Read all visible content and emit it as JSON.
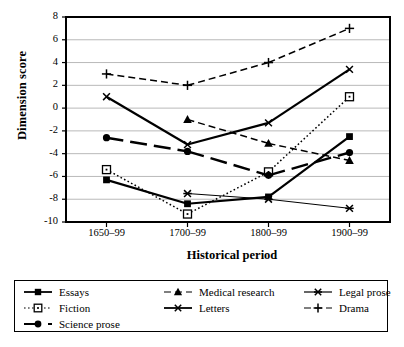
{
  "chart_data": {
    "type": "line",
    "title": "",
    "xlabel": "Historical period",
    "ylabel": "Dimension score",
    "categories": [
      "1650–99",
      "1700–99",
      "1800–99",
      "1900–99"
    ],
    "ylim": [
      -10,
      8
    ],
    "yticks": [
      8,
      6,
      4,
      2,
      0,
      -2,
      -4,
      -6,
      -8,
      -10
    ],
    "ytick_labels": [
      "8",
      "6",
      "4",
      "2",
      "0",
      "-2",
      "-4",
      "-6",
      "-8",
      "-10"
    ],
    "grid": "horizontal",
    "legend_position": "below-plot",
    "series": [
      {
        "name": "Essays",
        "marker": "filled-square",
        "line": "solid",
        "values": [
          -6.3,
          -8.4,
          -7.8,
          -2.5
        ]
      },
      {
        "name": "Medical research",
        "marker": "filled-triangle",
        "line": "dashed",
        "values": [
          null,
          -1.0,
          -3.1,
          -4.6
        ]
      },
      {
        "name": "Legal prose",
        "marker": "star-x",
        "line": "thin-solid",
        "values": [
          null,
          -7.5,
          -8.0,
          -8.8
        ]
      },
      {
        "name": "Fiction",
        "marker": "open-square",
        "line": "dotted",
        "values": [
          -5.4,
          -9.3,
          -5.6,
          1.0
        ]
      },
      {
        "name": "Letters",
        "marker": "cross-x",
        "line": "solid",
        "values": [
          1.0,
          -3.2,
          -1.3,
          3.4
        ]
      },
      {
        "name": "Drama",
        "marker": "plus",
        "line": "dashed",
        "values": [
          3.0,
          2.0,
          4.0,
          7.0
        ]
      },
      {
        "name": "Science prose",
        "marker": "filled-circle",
        "line": "long-dash",
        "values": [
          -2.6,
          -3.8,
          -5.9,
          -3.9
        ]
      }
    ]
  },
  "legend": {
    "columns": 3,
    "items": [
      {
        "label": "Essays"
      },
      {
        "label": "Medical research"
      },
      {
        "label": "Legal prose"
      },
      {
        "label": "Fiction"
      },
      {
        "label": "Letters"
      },
      {
        "label": "Drama"
      },
      {
        "label": "Science prose"
      }
    ]
  },
  "colors": {
    "ink": "#000000",
    "grid": "#b9b9b9",
    "axis": "#000000",
    "background": "#ffffff"
  }
}
